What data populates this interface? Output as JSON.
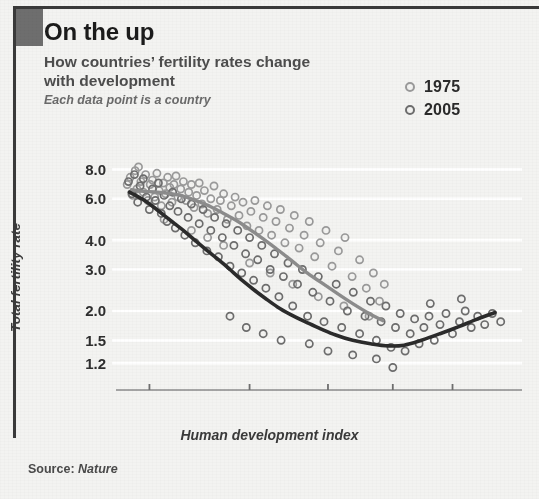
{
  "header": {
    "title": "On the up",
    "subtitle": "How countries’ fertility rates change with development",
    "caption": "Each data point is a country"
  },
  "legend": {
    "position": "top-right",
    "items": [
      {
        "label": "1975",
        "marker": "open-circle-icon",
        "color": "#9a9a9a"
      },
      {
        "label": "2005",
        "marker": "open-circle-icon",
        "color": "#6d6d6d"
      }
    ]
  },
  "source": {
    "prefix": "Source:",
    "publication": "Nature"
  },
  "chart_data": {
    "type": "scatter",
    "title": "On the up",
    "subtitle": "How countries’ fertility rates change with development",
    "annotation": "Each data point is a country",
    "xlabel": "Human development index",
    "ylabel": "Total fertility rate",
    "grid": "horizontal-white-gridlines",
    "x_scale": "nonlinear (logit-like, expanded at high HDI)",
    "y_scale": "log",
    "xlim": [
      0.22,
      0.975
    ],
    "ylim": [
      1.1,
      8.6
    ],
    "xticks": [
      0.3,
      0.6,
      0.8,
      0.9,
      0.95
    ],
    "xtick_labels": [
      "0.30",
      "0.60",
      "0.80",
      "0.90",
      "0.95"
    ],
    "yticks": [
      8.0,
      6.0,
      4.0,
      3.0,
      2.0,
      1.5,
      1.2
    ],
    "ytick_labels": [
      "8.0",
      "6.0",
      "4.0",
      "3.0",
      "2.0",
      "1.5",
      "1.2"
    ],
    "series": [
      {
        "name": "1975",
        "kind": "scatter+trend",
        "marker": "open circle",
        "color": "#9a9a9a",
        "trend_color": "#8c8c8c",
        "trend_note": "monotonically decreasing: high fertility at low HDI falling to ~1.8 near HDI 0.87",
        "trend": [
          [
            0.255,
            6.55
          ],
          [
            0.285,
            6.45
          ],
          [
            0.315,
            6.42
          ],
          [
            0.345,
            6.35
          ],
          [
            0.375,
            6.25
          ],
          [
            0.405,
            6.1
          ],
          [
            0.44,
            5.85
          ],
          [
            0.48,
            5.55
          ],
          [
            0.52,
            5.2
          ],
          [
            0.56,
            4.85
          ],
          [
            0.6,
            4.45
          ],
          [
            0.64,
            4.05
          ],
          [
            0.68,
            3.65
          ],
          [
            0.715,
            3.3
          ],
          [
            0.75,
            2.95
          ],
          [
            0.785,
            2.65
          ],
          [
            0.815,
            2.4
          ],
          [
            0.845,
            2.15
          ],
          [
            0.87,
            1.95
          ],
          [
            0.888,
            1.82
          ]
        ],
        "points": [
          [
            0.245,
            6.9
          ],
          [
            0.252,
            7.4
          ],
          [
            0.258,
            6.2
          ],
          [
            0.264,
            7.9
          ],
          [
            0.268,
            6.6
          ],
          [
            0.272,
            8.2
          ],
          [
            0.278,
            7.1
          ],
          [
            0.284,
            6.4
          ],
          [
            0.29,
            7.6
          ],
          [
            0.296,
            5.9
          ],
          [
            0.302,
            6.9
          ],
          [
            0.308,
            7.2
          ],
          [
            0.314,
            6.1
          ],
          [
            0.32,
            7.7
          ],
          [
            0.326,
            6.5
          ],
          [
            0.332,
            5.6
          ],
          [
            0.338,
            7.0
          ],
          [
            0.344,
            6.3
          ],
          [
            0.35,
            7.4
          ],
          [
            0.356,
            6.7
          ],
          [
            0.362,
            5.8
          ],
          [
            0.368,
            6.9
          ],
          [
            0.374,
            7.5
          ],
          [
            0.38,
            6.1
          ],
          [
            0.388,
            6.6
          ],
          [
            0.396,
            7.1
          ],
          [
            0.404,
            5.9
          ],
          [
            0.412,
            6.4
          ],
          [
            0.42,
            6.9
          ],
          [
            0.428,
            5.5
          ],
          [
            0.436,
            6.2
          ],
          [
            0.444,
            7.0
          ],
          [
            0.452,
            5.7
          ],
          [
            0.46,
            6.5
          ],
          [
            0.47,
            5.2
          ],
          [
            0.48,
            6.0
          ],
          [
            0.49,
            6.8
          ],
          [
            0.5,
            5.4
          ],
          [
            0.51,
            5.9
          ],
          [
            0.52,
            6.3
          ],
          [
            0.532,
            4.9
          ],
          [
            0.544,
            5.6
          ],
          [
            0.556,
            6.1
          ],
          [
            0.568,
            5.1
          ],
          [
            0.58,
            5.8
          ],
          [
            0.592,
            4.6
          ],
          [
            0.604,
            5.3
          ],
          [
            0.616,
            5.9
          ],
          [
            0.628,
            4.4
          ],
          [
            0.64,
            5.0
          ],
          [
            0.652,
            5.6
          ],
          [
            0.664,
            4.2
          ],
          [
            0.676,
            4.8
          ],
          [
            0.688,
            5.4
          ],
          [
            0.7,
            3.9
          ],
          [
            0.712,
            4.5
          ],
          [
            0.724,
            5.1
          ],
          [
            0.736,
            3.7
          ],
          [
            0.748,
            4.2
          ],
          [
            0.76,
            4.8
          ],
          [
            0.772,
            3.4
          ],
          [
            0.784,
            3.9
          ],
          [
            0.796,
            4.4
          ],
          [
            0.808,
            3.1
          ],
          [
            0.82,
            3.6
          ],
          [
            0.832,
            4.1
          ],
          [
            0.844,
            2.8
          ],
          [
            0.856,
            3.3
          ],
          [
            0.866,
            2.5
          ],
          [
            0.876,
            2.9
          ],
          [
            0.884,
            2.2
          ],
          [
            0.89,
            2.6
          ],
          [
            0.34,
            4.9
          ],
          [
            0.42,
            4.4
          ],
          [
            0.47,
            4.1
          ],
          [
            0.52,
            3.8
          ],
          [
            0.6,
            3.2
          ],
          [
            0.66,
            2.9
          ],
          [
            0.72,
            2.6
          ],
          [
            0.78,
            2.3
          ],
          [
            0.83,
            2.1
          ],
          [
            0.87,
            1.9
          ]
        ]
      },
      {
        "name": "2005",
        "kind": "scatter+trend",
        "marker": "open circle",
        "color": "#6d6d6d",
        "trend_color": "#2b2b2b",
        "trend_note": "J-shaped: falls steeply from ~6.4 at HDI 0.26 to a minimum ~1.42 near HDI 0.91, then rises to ~2.0 at HDI 0.97",
        "trend": [
          [
            0.25,
            6.4
          ],
          [
            0.28,
            6.0
          ],
          [
            0.31,
            5.55
          ],
          [
            0.34,
            5.1
          ],
          [
            0.37,
            4.7
          ],
          [
            0.4,
            4.35
          ],
          [
            0.435,
            3.95
          ],
          [
            0.47,
            3.6
          ],
          [
            0.505,
            3.3
          ],
          [
            0.54,
            3.0
          ],
          [
            0.575,
            2.72
          ],
          [
            0.61,
            2.48
          ],
          [
            0.645,
            2.27
          ],
          [
            0.68,
            2.08
          ],
          [
            0.715,
            1.93
          ],
          [
            0.75,
            1.8
          ],
          [
            0.785,
            1.68
          ],
          [
            0.815,
            1.58
          ],
          [
            0.845,
            1.5
          ],
          [
            0.872,
            1.45
          ],
          [
            0.895,
            1.42
          ],
          [
            0.912,
            1.43
          ],
          [
            0.928,
            1.5
          ],
          [
            0.942,
            1.6
          ],
          [
            0.954,
            1.72
          ],
          [
            0.963,
            1.85
          ],
          [
            0.97,
            1.97
          ]
        ],
        "points": [
          [
            0.248,
            7.1
          ],
          [
            0.256,
            6.3
          ],
          [
            0.262,
            7.6
          ],
          [
            0.27,
            5.8
          ],
          [
            0.276,
            6.8
          ],
          [
            0.284,
            7.3
          ],
          [
            0.292,
            6.1
          ],
          [
            0.3,
            5.4
          ],
          [
            0.308,
            6.6
          ],
          [
            0.316,
            5.9
          ],
          [
            0.324,
            7.0
          ],
          [
            0.332,
            5.2
          ],
          [
            0.34,
            6.2
          ],
          [
            0.348,
            4.8
          ],
          [
            0.356,
            5.6
          ],
          [
            0.364,
            6.4
          ],
          [
            0.372,
            4.5
          ],
          [
            0.38,
            5.3
          ],
          [
            0.39,
            6.0
          ],
          [
            0.4,
            4.2
          ],
          [
            0.41,
            5.0
          ],
          [
            0.42,
            5.7
          ],
          [
            0.432,
            3.9
          ],
          [
            0.444,
            4.7
          ],
          [
            0.456,
            5.4
          ],
          [
            0.468,
            3.6
          ],
          [
            0.48,
            4.4
          ],
          [
            0.492,
            5.0
          ],
          [
            0.504,
            3.4
          ],
          [
            0.516,
            4.1
          ],
          [
            0.528,
            4.7
          ],
          [
            0.54,
            3.1
          ],
          [
            0.552,
            3.8
          ],
          [
            0.564,
            4.4
          ],
          [
            0.576,
            2.9
          ],
          [
            0.588,
            3.5
          ],
          [
            0.6,
            4.1
          ],
          [
            0.612,
            2.7
          ],
          [
            0.624,
            3.3
          ],
          [
            0.636,
            3.8
          ],
          [
            0.648,
            2.5
          ],
          [
            0.66,
            3.0
          ],
          [
            0.672,
            3.5
          ],
          [
            0.684,
            2.3
          ],
          [
            0.696,
            2.8
          ],
          [
            0.708,
            3.2
          ],
          [
            0.72,
            2.1
          ],
          [
            0.732,
            2.6
          ],
          [
            0.744,
            3.0
          ],
          [
            0.756,
            1.9
          ],
          [
            0.768,
            2.4
          ],
          [
            0.78,
            2.8
          ],
          [
            0.792,
            1.8
          ],
          [
            0.804,
            2.2
          ],
          [
            0.816,
            2.6
          ],
          [
            0.826,
            1.7
          ],
          [
            0.836,
            2.0
          ],
          [
            0.846,
            2.4
          ],
          [
            0.856,
            1.6
          ],
          [
            0.864,
            1.9
          ],
          [
            0.872,
            2.2
          ],
          [
            0.88,
            1.5
          ],
          [
            0.886,
            1.8
          ],
          [
            0.892,
            2.1
          ],
          [
            0.898,
            1.4
          ],
          [
            0.903,
            1.7
          ],
          [
            0.908,
            1.95
          ],
          [
            0.913,
            1.35
          ],
          [
            0.918,
            1.6
          ],
          [
            0.922,
            1.85
          ],
          [
            0.926,
            1.45
          ],
          [
            0.93,
            1.7
          ],
          [
            0.934,
            1.9
          ],
          [
            0.938,
            1.5
          ],
          [
            0.942,
            1.75
          ],
          [
            0.946,
            1.95
          ],
          [
            0.95,
            1.6
          ],
          [
            0.954,
            1.8
          ],
          [
            0.957,
            2.0
          ],
          [
            0.96,
            1.7
          ],
          [
            0.963,
            1.9
          ],
          [
            0.966,
            1.75
          ],
          [
            0.969,
            1.95
          ],
          [
            0.972,
            1.8
          ],
          [
            0.88,
            1.25
          ],
          [
            0.845,
            1.3
          ],
          [
            0.8,
            1.35
          ],
          [
            0.76,
            1.45
          ],
          [
            0.935,
            2.15
          ],
          [
            0.955,
            2.25
          ],
          [
            0.69,
            1.5
          ],
          [
            0.64,
            1.6
          ],
          [
            0.59,
            1.7
          ],
          [
            0.54,
            1.9
          ],
          [
            0.9,
            1.15
          ]
        ]
      }
    ]
  }
}
